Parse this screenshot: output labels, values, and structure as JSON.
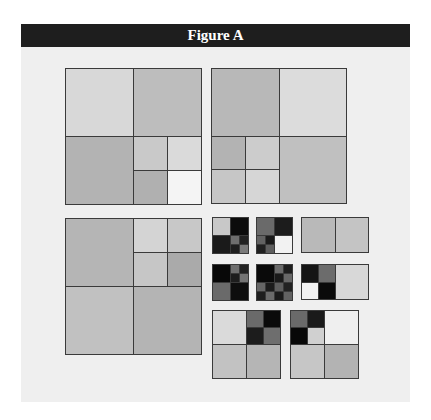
{
  "figure": {
    "title": "Figure A",
    "colors": {
      "header_bg": "#1e1e1e",
      "panel_bg": "#efefef",
      "border": "#3a3a3a"
    }
  },
  "diagrams": [
    {
      "name": "quadtree-top-left",
      "x": 65,
      "y": 68,
      "size": 136,
      "cells": [
        {
          "x": 0,
          "y": 0,
          "w": 0.5,
          "h": 0.5,
          "fill": "#d8d8d8"
        },
        {
          "x": 0.5,
          "y": 0,
          "w": 0.5,
          "h": 0.5,
          "fill": "#bdbdbd"
        },
        {
          "x": 0,
          "y": 0.5,
          "w": 0.5,
          "h": 0.5,
          "fill": "#b3b3b3"
        },
        {
          "x": 0.5,
          "y": 0.5,
          "w": 0.25,
          "h": 0.25,
          "fill": "#c9c9c9"
        },
        {
          "x": 0.75,
          "y": 0.5,
          "w": 0.25,
          "h": 0.25,
          "fill": "#dadada"
        },
        {
          "x": 0.5,
          "y": 0.75,
          "w": 0.25,
          "h": 0.25,
          "fill": "#b0b0b0"
        },
        {
          "x": 0.75,
          "y": 0.75,
          "w": 0.25,
          "h": 0.25,
          "fill": "#f4f4f4"
        }
      ]
    },
    {
      "name": "quadtree-top-right",
      "x": 211,
      "y": 68,
      "size": 135,
      "cells": [
        {
          "x": 0,
          "y": 0,
          "w": 0.5,
          "h": 0.5,
          "fill": "#b8b8b8"
        },
        {
          "x": 0.5,
          "y": 0,
          "w": 0.5,
          "h": 0.5,
          "fill": "#dcdcdc"
        },
        {
          "x": 0,
          "y": 0.5,
          "w": 0.25,
          "h": 0.25,
          "fill": "#b3b3b3"
        },
        {
          "x": 0.25,
          "y": 0.5,
          "w": 0.25,
          "h": 0.25,
          "fill": "#cccccc"
        },
        {
          "x": 0,
          "y": 0.75,
          "w": 0.25,
          "h": 0.25,
          "fill": "#c6c6c6"
        },
        {
          "x": 0.25,
          "y": 0.75,
          "w": 0.25,
          "h": 0.25,
          "fill": "#d6d6d6"
        },
        {
          "x": 0.5,
          "y": 0.5,
          "w": 0.5,
          "h": 0.5,
          "fill": "#c0c0c0"
        }
      ]
    },
    {
      "name": "quadtree-bottom-left",
      "x": 65,
      "y": 218,
      "size": 136,
      "cells": [
        {
          "x": 0,
          "y": 0,
          "w": 0.5,
          "h": 0.5,
          "fill": "#b5b5b5"
        },
        {
          "x": 0.5,
          "y": 0,
          "w": 0.25,
          "h": 0.25,
          "fill": "#d4d4d4"
        },
        {
          "x": 0.75,
          "y": 0,
          "w": 0.25,
          "h": 0.25,
          "fill": "#c8c8c8"
        },
        {
          "x": 0.5,
          "y": 0.25,
          "w": 0.25,
          "h": 0.25,
          "fill": "#c6c6c6"
        },
        {
          "x": 0.75,
          "y": 0.25,
          "w": 0.25,
          "h": 0.25,
          "fill": "#aaaaaa"
        },
        {
          "x": 0,
          "y": 0.5,
          "w": 0.5,
          "h": 0.5,
          "fill": "#c1c1c1"
        },
        {
          "x": 0.5,
          "y": 0.5,
          "w": 0.5,
          "h": 0.5,
          "fill": "#b4b4b4"
        }
      ]
    },
    {
      "name": "block-grid-1",
      "x": 212,
      "y": 217,
      "size": 36,
      "cells": [
        {
          "x": 0,
          "y": 0,
          "w": 0.5,
          "h": 0.5,
          "fill": "#c8c8c8"
        },
        {
          "x": 0.5,
          "y": 0,
          "w": 0.5,
          "h": 0.5,
          "fill": "#0c0c0c"
        },
        {
          "x": 0,
          "y": 0.5,
          "w": 0.5,
          "h": 0.5,
          "fill": "#1a1a1a"
        },
        {
          "x": 0.5,
          "y": 0.5,
          "w": 0.25,
          "h": 0.25,
          "fill": "#6e6e6e"
        },
        {
          "x": 0.75,
          "y": 0.5,
          "w": 0.25,
          "h": 0.25,
          "fill": "#222222"
        },
        {
          "x": 0.5,
          "y": 0.75,
          "w": 0.25,
          "h": 0.25,
          "fill": "#1e1e1e"
        },
        {
          "x": 0.75,
          "y": 0.75,
          "w": 0.25,
          "h": 0.25,
          "fill": "#7a7a7a"
        }
      ]
    },
    {
      "name": "block-grid-2",
      "x": 256,
      "y": 217,
      "size": 36,
      "cells": [
        {
          "x": 0,
          "y": 0,
          "w": 0.5,
          "h": 0.5,
          "fill": "#6a6a6a"
        },
        {
          "x": 0.5,
          "y": 0,
          "w": 0.5,
          "h": 0.5,
          "fill": "#1c1c1c"
        },
        {
          "x": 0,
          "y": 0.5,
          "w": 0.25,
          "h": 0.25,
          "fill": "#626262"
        },
        {
          "x": 0.25,
          "y": 0.5,
          "w": 0.25,
          "h": 0.25,
          "fill": "#1a1a1a"
        },
        {
          "x": 0,
          "y": 0.75,
          "w": 0.25,
          "h": 0.25,
          "fill": "#202020"
        },
        {
          "x": 0.25,
          "y": 0.75,
          "w": 0.25,
          "h": 0.25,
          "fill": "#5e5e5e"
        },
        {
          "x": 0.5,
          "y": 0.5,
          "w": 0.5,
          "h": 0.5,
          "fill": "#f2f2f2"
        }
      ]
    },
    {
      "name": "block-grid-3",
      "x": 212,
      "y": 264,
      "size": 36,
      "cells": [
        {
          "x": 0,
          "y": 0,
          "w": 0.5,
          "h": 0.5,
          "fill": "#080808"
        },
        {
          "x": 0.5,
          "y": 0,
          "w": 0.25,
          "h": 0.25,
          "fill": "#6e6e6e"
        },
        {
          "x": 0.75,
          "y": 0,
          "w": 0.25,
          "h": 0.25,
          "fill": "#222222"
        },
        {
          "x": 0.5,
          "y": 0.25,
          "w": 0.25,
          "h": 0.25,
          "fill": "#1e1e1e"
        },
        {
          "x": 0.75,
          "y": 0.25,
          "w": 0.25,
          "h": 0.25,
          "fill": "#747474"
        },
        {
          "x": 0,
          "y": 0.5,
          "w": 0.5,
          "h": 0.5,
          "fill": "#6a6a6a"
        },
        {
          "x": 0.5,
          "y": 0.5,
          "w": 0.5,
          "h": 0.5,
          "fill": "#0e0e0e"
        }
      ]
    },
    {
      "name": "block-grid-4",
      "x": 256,
      "y": 264,
      "size": 36,
      "cells": [
        {
          "x": 0,
          "y": 0,
          "w": 0.5,
          "h": 0.5,
          "fill": "#0a0a0a"
        },
        {
          "x": 0.5,
          "y": 0,
          "w": 0.25,
          "h": 0.25,
          "fill": "#6a6a6a"
        },
        {
          "x": 0.75,
          "y": 0,
          "w": 0.25,
          "h": 0.25,
          "fill": "#1e1e1e"
        },
        {
          "x": 0.5,
          "y": 0.25,
          "w": 0.25,
          "h": 0.25,
          "fill": "#1a1a1a"
        },
        {
          "x": 0.75,
          "y": 0.25,
          "w": 0.25,
          "h": 0.25,
          "fill": "#686868"
        },
        {
          "x": 0,
          "y": 0.5,
          "w": 0.25,
          "h": 0.25,
          "fill": "#666666"
        },
        {
          "x": 0.25,
          "y": 0.5,
          "w": 0.25,
          "h": 0.25,
          "fill": "#1c1c1c"
        },
        {
          "x": 0.5,
          "y": 0.5,
          "w": 0.25,
          "h": 0.25,
          "fill": "#5e5e5e"
        },
        {
          "x": 0.75,
          "y": 0.5,
          "w": 0.25,
          "h": 0.25,
          "fill": "#222222"
        },
        {
          "x": 0,
          "y": 0.75,
          "w": 0.25,
          "h": 0.25,
          "fill": "#1e1e1e"
        },
        {
          "x": 0.25,
          "y": 0.75,
          "w": 0.25,
          "h": 0.25,
          "fill": "#6a6a6a"
        },
        {
          "x": 0.5,
          "y": 0.75,
          "w": 0.25,
          "h": 0.25,
          "fill": "#1a1a1a"
        },
        {
          "x": 0.75,
          "y": 0.75,
          "w": 0.25,
          "h": 0.25,
          "fill": "#626262"
        }
      ]
    },
    {
      "name": "bar-1",
      "x": 301,
      "y": 217,
      "w": 67,
      "h": 35,
      "cells": [
        {
          "x": 0,
          "y": 0,
          "w": 0.5,
          "h": 1,
          "fill": "#b9b9b9"
        },
        {
          "x": 0.5,
          "y": 0,
          "w": 0.5,
          "h": 1,
          "fill": "#c4c4c4"
        }
      ]
    },
    {
      "name": "bar-2",
      "x": 301,
      "y": 264,
      "w": 67,
      "h": 35,
      "cells": [
        {
          "x": 0,
          "y": 0,
          "w": 0.25,
          "h": 0.5,
          "fill": "#151515"
        },
        {
          "x": 0.25,
          "y": 0,
          "w": 0.25,
          "h": 0.5,
          "fill": "#6c6c6c"
        },
        {
          "x": 0,
          "y": 0.5,
          "w": 0.25,
          "h": 0.5,
          "fill": "#f2f2f2"
        },
        {
          "x": 0.25,
          "y": 0.5,
          "w": 0.25,
          "h": 0.5,
          "fill": "#0a0a0a"
        },
        {
          "x": 0.5,
          "y": 0,
          "w": 0.5,
          "h": 1,
          "fill": "#d8d8d8"
        }
      ]
    },
    {
      "name": "quadtree-small-1",
      "x": 212,
      "y": 310,
      "size": 68,
      "cells": [
        {
          "x": 0,
          "y": 0,
          "w": 0.5,
          "h": 0.5,
          "fill": "#dadada"
        },
        {
          "x": 0.5,
          "y": 0,
          "w": 0.25,
          "h": 0.25,
          "fill": "#6a6a6a"
        },
        {
          "x": 0.75,
          "y": 0,
          "w": 0.25,
          "h": 0.25,
          "fill": "#0a0a0a"
        },
        {
          "x": 0.5,
          "y": 0.25,
          "w": 0.25,
          "h": 0.25,
          "fill": "#1c1c1c"
        },
        {
          "x": 0.75,
          "y": 0.25,
          "w": 0.25,
          "h": 0.25,
          "fill": "#6e6e6e"
        },
        {
          "x": 0,
          "y": 0.5,
          "w": 0.5,
          "h": 0.5,
          "fill": "#c2c2c2"
        },
        {
          "x": 0.5,
          "y": 0.5,
          "w": 0.5,
          "h": 0.5,
          "fill": "#b5b5b5"
        }
      ]
    },
    {
      "name": "quadtree-small-2",
      "x": 290,
      "y": 310,
      "size": 68,
      "cells": [
        {
          "x": 0,
          "y": 0,
          "w": 0.25,
          "h": 0.25,
          "fill": "#6a6a6a"
        },
        {
          "x": 0.25,
          "y": 0,
          "w": 0.25,
          "h": 0.25,
          "fill": "#1a1a1a"
        },
        {
          "x": 0,
          "y": 0.25,
          "w": 0.25,
          "h": 0.25,
          "fill": "#080808"
        },
        {
          "x": 0.25,
          "y": 0.25,
          "w": 0.25,
          "h": 0.25,
          "fill": "#d0d0d0"
        },
        {
          "x": 0.5,
          "y": 0,
          "w": 0.5,
          "h": 0.5,
          "fill": "#efefef"
        },
        {
          "x": 0,
          "y": 0.5,
          "w": 0.5,
          "h": 0.5,
          "fill": "#c6c6c6"
        },
        {
          "x": 0.5,
          "y": 0.5,
          "w": 0.5,
          "h": 0.5,
          "fill": "#b3b3b3"
        }
      ]
    }
  ]
}
